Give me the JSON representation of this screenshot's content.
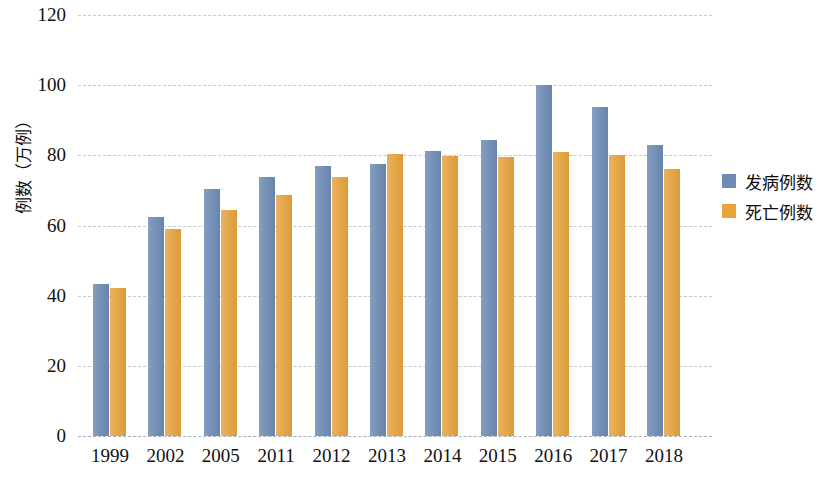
{
  "chart_data": {
    "type": "bar",
    "title": "",
    "xlabel": "",
    "ylabel": "例数（万例）",
    "ylim": [
      0,
      120
    ],
    "yticks": [
      0,
      20,
      40,
      60,
      80,
      100,
      120
    ],
    "ytick_labels": [
      "0",
      "20",
      "40",
      "60",
      "80",
      "100",
      "120"
    ],
    "grid": true,
    "legend_position": "right",
    "categories": [
      "1999",
      "2002",
      "2005",
      "2011",
      "2012",
      "2013",
      "2014",
      "2015",
      "2016",
      "2017",
      "2018"
    ],
    "series": [
      {
        "name": "发病例数",
        "color": "#6d8bb5",
        "values": [
          43.4,
          62.3,
          70.3,
          73.7,
          77.1,
          77.4,
          81.1,
          84.3,
          100.0,
          93.7,
          82.9
        ]
      },
      {
        "name": "死亡例数",
        "color": "#e8a33d",
        "values": [
          42.3,
          59.1,
          64.3,
          68.6,
          73.7,
          80.3,
          79.7,
          79.4,
          80.9,
          80.0,
          76.0
        ]
      }
    ]
  },
  "colors": {
    "series_blue": "#6d8bb5",
    "series_orange": "#e8a33d",
    "gridline": "#b9bfc9",
    "text": "#111111",
    "background": "#ffffff"
  }
}
